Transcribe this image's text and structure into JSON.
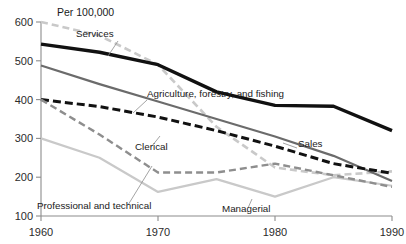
{
  "chart_data": {
    "type": "line",
    "title": "",
    "unit_label": "Per 100,000",
    "xlabel": "",
    "ylabel": "",
    "x": [
      1960,
      1965,
      1970,
      1975,
      1980,
      1985,
      1990
    ],
    "xticks": [
      "1960",
      "1970",
      "1980",
      "1990"
    ],
    "xlim": [
      1960,
      1990
    ],
    "ylim": [
      100,
      600
    ],
    "yticks": [
      "100",
      "200",
      "300",
      "400",
      "500",
      "600"
    ],
    "grid": false,
    "legend": "inline-annotations",
    "series": [
      {
        "name": "Services",
        "values": [
          600,
          565,
          490,
          330,
          225,
          205,
          215
        ],
        "color": "#c9c9c9",
        "style": "dashed",
        "label": "Services",
        "label_x": 76,
        "label_y": 37
      },
      {
        "name": "Agriculture, forestry, and fishing",
        "values": [
          543,
          522,
          490,
          420,
          385,
          383,
          320
        ],
        "color": "#111111",
        "style": "solid",
        "label": "Agriculture, forestry, and fishing",
        "label_x": 147,
        "label_y": 97
      },
      {
        "name": "Sales",
        "values": [
          488,
          440,
          395,
          350,
          305,
          255,
          190
        ],
        "color": "#6b6b6b",
        "style": "solid",
        "label": "Sales",
        "label_x": 298,
        "label_y": 147
      },
      {
        "name": "Clerical",
        "values": [
          400,
          382,
          355,
          320,
          280,
          235,
          210
        ],
        "color": "#111111",
        "style": "dashed",
        "label": "Clerical",
        "label_x": 135,
        "label_y": 150
      },
      {
        "name": "Professional and technical",
        "values": [
          300,
          250,
          162,
          195,
          150,
          200,
          178
        ],
        "color": "#c9c9c9",
        "style": "solid",
        "label": "Professional and technical",
        "label_x": 37,
        "label_y": 209
      },
      {
        "name": "Managerial",
        "values": [
          400,
          310,
          212,
          212,
          235,
          205,
          175
        ],
        "color": "#8e8e8e",
        "style": "dashed",
        "label": "Managerial",
        "label_x": 222,
        "label_y": 212
      }
    ]
  }
}
